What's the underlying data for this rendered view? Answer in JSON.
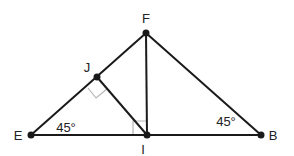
{
  "diagram": {
    "type": "geometry",
    "colors": {
      "line": "#1a1a1a",
      "marker": "#b5b5b5",
      "point": "#1a1a1a",
      "text": "#222222"
    },
    "points": [
      {
        "name": "F",
        "x": 146,
        "y": 33,
        "label_x": 146,
        "label_y": 18
      },
      {
        "name": "J",
        "x": 97,
        "y": 77,
        "label_x": 87,
        "label_y": 67
      },
      {
        "name": "E",
        "x": 31,
        "y": 135,
        "label_x": 18,
        "label_y": 135
      },
      {
        "name": "I",
        "x": 147,
        "y": 135,
        "label_x": 143,
        "label_y": 149
      },
      {
        "name": "B",
        "x": 261,
        "y": 135,
        "label_x": 273,
        "label_y": 135
      }
    ],
    "segments": [
      [
        "E",
        "B"
      ],
      [
        "E",
        "F"
      ],
      [
        "F",
        "B"
      ],
      [
        "F",
        "I"
      ],
      [
        "J",
        "I"
      ]
    ],
    "angles": [
      {
        "vertex": "E",
        "text": "45°",
        "x": 66,
        "y": 127
      },
      {
        "vertex": "B",
        "text": "45°",
        "x": 226,
        "y": 121
      }
    ],
    "right_angles": [
      {
        "vertex": "J",
        "between": [
          "E",
          "I"
        ]
      },
      {
        "vertex": "I",
        "between": [
          "E",
          "F"
        ]
      }
    ]
  }
}
